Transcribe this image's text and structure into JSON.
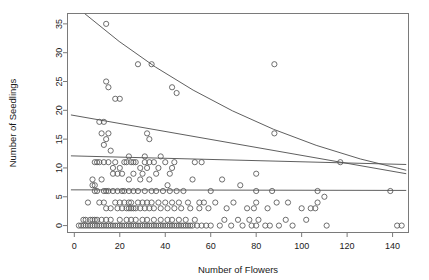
{
  "chart_data": {
    "type": "scatter",
    "title": "",
    "xlabel": "Number of Flowers",
    "ylabel": "Number of Seedlings",
    "xlim": [
      -3,
      147
    ],
    "ylim": [
      -1.2,
      36.8
    ],
    "xticks": [
      0,
      20,
      40,
      60,
      80,
      100,
      120,
      140
    ],
    "yticks": [
      0,
      5,
      10,
      15,
      20,
      25,
      30,
      35
    ],
    "xtick_labels": [
      "0",
      "20",
      "40",
      "60",
      "80",
      "100",
      "120",
      "140"
    ],
    "ytick_labels": [
      "0",
      "5",
      "10",
      "15",
      "20",
      "25",
      "30",
      "35"
    ],
    "grid": false,
    "legend": null,
    "point_marker": "open-circle",
    "point_radius_px": 2.6,
    "points": [
      [
        2,
        0
      ],
      [
        3,
        0
      ],
      [
        4,
        0
      ],
      [
        4,
        1
      ],
      [
        5,
        0
      ],
      [
        5,
        1
      ],
      [
        6,
        0
      ],
      [
        6,
        4
      ],
      [
        7,
        0
      ],
      [
        7,
        1
      ],
      [
        8,
        0
      ],
      [
        8,
        1
      ],
      [
        8,
        7
      ],
      [
        8,
        8
      ],
      [
        9,
        0
      ],
      [
        9,
        1
      ],
      [
        9,
        6
      ],
      [
        9,
        7
      ],
      [
        9,
        11
      ],
      [
        10,
        0
      ],
      [
        10,
        1
      ],
      [
        10,
        6
      ],
      [
        10,
        11
      ],
      [
        11,
        0
      ],
      [
        11,
        4
      ],
      [
        11,
        11
      ],
      [
        11,
        18
      ],
      [
        12,
        0
      ],
      [
        12,
        1
      ],
      [
        12,
        8
      ],
      [
        12,
        16
      ],
      [
        13,
        0
      ],
      [
        13,
        4
      ],
      [
        13,
        6
      ],
      [
        13,
        11
      ],
      [
        13,
        14
      ],
      [
        13,
        18
      ],
      [
        14,
        0
      ],
      [
        14,
        1
      ],
      [
        14,
        3
      ],
      [
        14,
        6
      ],
      [
        14,
        15
      ],
      [
        14,
        25
      ],
      [
        14,
        35
      ],
      [
        15,
        0
      ],
      [
        15,
        6
      ],
      [
        15,
        11
      ],
      [
        15,
        16
      ],
      [
        15,
        24
      ],
      [
        16,
        0
      ],
      [
        16,
        1
      ],
      [
        16,
        3
      ],
      [
        16,
        13
      ],
      [
        17,
        0
      ],
      [
        17,
        6
      ],
      [
        17,
        9
      ],
      [
        17,
        10
      ],
      [
        18,
        0
      ],
      [
        18,
        4
      ],
      [
        18,
        11
      ],
      [
        18,
        22
      ],
      [
        19,
        0
      ],
      [
        19,
        3
      ],
      [
        19,
        6
      ],
      [
        19,
        9
      ],
      [
        20,
        0
      ],
      [
        20,
        1
      ],
      [
        20,
        4
      ],
      [
        20,
        10
      ],
      [
        20,
        22
      ],
      [
        21,
        0
      ],
      [
        21,
        3
      ],
      [
        21,
        6
      ],
      [
        21,
        9
      ],
      [
        22,
        0
      ],
      [
        22,
        4
      ],
      [
        22,
        6
      ],
      [
        22,
        11
      ],
      [
        23,
        0
      ],
      [
        23,
        1
      ],
      [
        23,
        3
      ],
      [
        23,
        11
      ],
      [
        24,
        0
      ],
      [
        24,
        3
      ],
      [
        24,
        4
      ],
      [
        24,
        6
      ],
      [
        24,
        8
      ],
      [
        24,
        12
      ],
      [
        25,
        0
      ],
      [
        25,
        1
      ],
      [
        25,
        3
      ],
      [
        25,
        4
      ],
      [
        25,
        11
      ],
      [
        26,
        0
      ],
      [
        26,
        3
      ],
      [
        26,
        6
      ],
      [
        26,
        9
      ],
      [
        26,
        11
      ],
      [
        27,
        0
      ],
      [
        27,
        1
      ],
      [
        27,
        3
      ],
      [
        27,
        11
      ],
      [
        28,
        0
      ],
      [
        28,
        4
      ],
      [
        28,
        6
      ],
      [
        28,
        28
      ],
      [
        29,
        0
      ],
      [
        29,
        3
      ],
      [
        29,
        8
      ],
      [
        29,
        10
      ],
      [
        30,
        0
      ],
      [
        30,
        1
      ],
      [
        30,
        4
      ],
      [
        30,
        9
      ],
      [
        31,
        0
      ],
      [
        31,
        3
      ],
      [
        31,
        6
      ],
      [
        31,
        11
      ],
      [
        31,
        12
      ],
      [
        32,
        0
      ],
      [
        32,
        1
      ],
      [
        32,
        4
      ],
      [
        32,
        10
      ],
      [
        32,
        16
      ],
      [
        33,
        0
      ],
      [
        33,
        3
      ],
      [
        33,
        8
      ],
      [
        33,
        11
      ],
      [
        33,
        15
      ],
      [
        34,
        0
      ],
      [
        34,
        4
      ],
      [
        34,
        6
      ],
      [
        34,
        28
      ],
      [
        35,
        0
      ],
      [
        35,
        1
      ],
      [
        35,
        3
      ],
      [
        35,
        11
      ],
      [
        36,
        0
      ],
      [
        36,
        6
      ],
      [
        36,
        9
      ],
      [
        37,
        0
      ],
      [
        37,
        4
      ],
      [
        37,
        10
      ],
      [
        38,
        0
      ],
      [
        38,
        1
      ],
      [
        38,
        3
      ],
      [
        38,
        12
      ],
      [
        39,
        0
      ],
      [
        39,
        6
      ],
      [
        40,
        0
      ],
      [
        40,
        4
      ],
      [
        40,
        11
      ],
      [
        41,
        0
      ],
      [
        41,
        1
      ],
      [
        41,
        3
      ],
      [
        41,
        7
      ],
      [
        42,
        0
      ],
      [
        42,
        6
      ],
      [
        42,
        9
      ],
      [
        43,
        0
      ],
      [
        43,
        1
      ],
      [
        43,
        4
      ],
      [
        43,
        10
      ],
      [
        43,
        24
      ],
      [
        44,
        0
      ],
      [
        44,
        3
      ],
      [
        44,
        11
      ],
      [
        45,
        0
      ],
      [
        45,
        6
      ],
      [
        45,
        23
      ],
      [
        46,
        0
      ],
      [
        46,
        1
      ],
      [
        46,
        4
      ],
      [
        47,
        0
      ],
      [
        47,
        3
      ],
      [
        48,
        0
      ],
      [
        48,
        6
      ],
      [
        49,
        0
      ],
      [
        49,
        1
      ],
      [
        50,
        0
      ],
      [
        50,
        4
      ],
      [
        51,
        0
      ],
      [
        51,
        3
      ],
      [
        52,
        0
      ],
      [
        52,
        8
      ],
      [
        53,
        1
      ],
      [
        53,
        11
      ],
      [
        54,
        0
      ],
      [
        55,
        3
      ],
      [
        55,
        4
      ],
      [
        56,
        0
      ],
      [
        56,
        11
      ],
      [
        57,
        4
      ],
      [
        58,
        0
      ],
      [
        59,
        3
      ],
      [
        60,
        0
      ],
      [
        60,
        6
      ],
      [
        62,
        4
      ],
      [
        64,
        0
      ],
      [
        65,
        8
      ],
      [
        66,
        1
      ],
      [
        67,
        3
      ],
      [
        69,
        0
      ],
      [
        70,
        4
      ],
      [
        72,
        1
      ],
      [
        73,
        7
      ],
      [
        74,
        0
      ],
      [
        76,
        3
      ],
      [
        77,
        1
      ],
      [
        78,
        0
      ],
      [
        79,
        3
      ],
      [
        80,
        0
      ],
      [
        80,
        4
      ],
      [
        80,
        6
      ],
      [
        80,
        9
      ],
      [
        81,
        1
      ],
      [
        84,
        0
      ],
      [
        85,
        3
      ],
      [
        86,
        0
      ],
      [
        87,
        6
      ],
      [
        88,
        16
      ],
      [
        88,
        28
      ],
      [
        89,
        4
      ],
      [
        90,
        0
      ],
      [
        93,
        1
      ],
      [
        94,
        4
      ],
      [
        96,
        0
      ],
      [
        100,
        3
      ],
      [
        102,
        1
      ],
      [
        104,
        3
      ],
      [
        106,
        3
      ],
      [
        107,
        6
      ],
      [
        107,
        4
      ],
      [
        110,
        5
      ],
      [
        111,
        0
      ],
      [
        117,
        11
      ],
      [
        139,
        6
      ],
      [
        142,
        0
      ],
      [
        144,
        0
      ]
    ],
    "fitted_curves": [
      {
        "name": "curve-top",
        "kind": "exponential-decay",
        "x_start": 4.5,
        "y_start": 36.8,
        "x_end": 146,
        "y_end": 9.6,
        "control_bias": 0.42
      },
      {
        "name": "line-upper",
        "kind": "linear",
        "x_start": -1.5,
        "y_start": 19.2,
        "x_end": 146,
        "y_end": 9.0
      },
      {
        "name": "line-middle",
        "kind": "linear",
        "x_start": -1.5,
        "y_start": 12.1,
        "x_end": 146,
        "y_end": 10.6
      },
      {
        "name": "line-lower",
        "kind": "linear",
        "x_start": -1.5,
        "y_start": 6.2,
        "x_end": 146,
        "y_end": 6.1
      }
    ]
  }
}
